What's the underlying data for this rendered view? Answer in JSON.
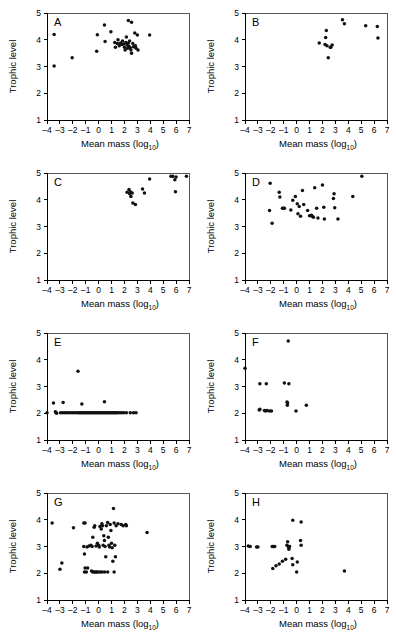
{
  "figure": {
    "axis_titles": {
      "x_main": "Mean mass (log",
      "x_sub": "10",
      "x_close": ")",
      "y": "Trophic level"
    },
    "x_ticks": [
      "-4",
      "-3",
      "-2",
      "-1",
      "0",
      "1",
      "2",
      "3",
      "4",
      "5",
      "6",
      "7"
    ],
    "y_ticks": [
      "1",
      "2",
      "3",
      "4",
      "5"
    ],
    "xlim": [
      -4,
      7
    ],
    "ylim": [
      1,
      5
    ],
    "point_color": "#111111",
    "axis_color": "#000000"
  },
  "chart_data": [
    {
      "type": "scatter",
      "panel": "A",
      "title": "A",
      "xlabel": "Mean mass (log10)",
      "ylabel": "Trophic level",
      "xlim": [
        -4,
        7
      ],
      "ylim": [
        1,
        5
      ],
      "grid": false,
      "legend": "none",
      "points": [
        [
          -3.45,
          4.2
        ],
        [
          -3.45,
          3.02
        ],
        [
          -2.05,
          3.33
        ],
        [
          -0.1,
          4.19
        ],
        [
          -0.15,
          3.57
        ],
        [
          0.45,
          4.55
        ],
        [
          0.5,
          3.93
        ],
        [
          0.95,
          4.3
        ],
        [
          1.25,
          3.9
        ],
        [
          1.3,
          3.72
        ],
        [
          1.45,
          3.86
        ],
        [
          1.5,
          4.0
        ],
        [
          1.6,
          3.78
        ],
        [
          1.7,
          3.88
        ],
        [
          1.8,
          3.82
        ],
        [
          1.85,
          3.95
        ],
        [
          1.95,
          3.84
        ],
        [
          2.0,
          3.72
        ],
        [
          2.05,
          3.62
        ],
        [
          2.1,
          3.9
        ],
        [
          2.15,
          4.1
        ],
        [
          2.2,
          3.8
        ],
        [
          2.25,
          3.68
        ],
        [
          2.3,
          3.88
        ],
        [
          2.35,
          3.76
        ],
        [
          2.4,
          3.95
        ],
        [
          2.45,
          3.7
        ],
        [
          2.5,
          3.62
        ],
        [
          2.3,
          4.72
        ],
        [
          2.55,
          4.65
        ],
        [
          2.55,
          3.5
        ],
        [
          2.65,
          3.86
        ],
        [
          2.7,
          3.74
        ],
        [
          2.8,
          4.25
        ],
        [
          2.85,
          3.78
        ],
        [
          2.9,
          3.68
        ],
        [
          3.05,
          3.62
        ],
        [
          3.0,
          4.18
        ],
        [
          3.95,
          4.18
        ]
      ]
    },
    {
      "type": "scatter",
      "panel": "B",
      "title": "B",
      "xlabel": "Mean mass (log10)",
      "ylabel": "Trophic level",
      "xlim": [
        -4,
        7
      ],
      "ylim": [
        1,
        5
      ],
      "grid": false,
      "legend": "none",
      "points": [
        [
          1.75,
          3.88
        ],
        [
          2.2,
          3.82
        ],
        [
          2.25,
          4.08
        ],
        [
          2.3,
          4.35
        ],
        [
          2.35,
          3.78
        ],
        [
          2.45,
          3.33
        ],
        [
          2.6,
          3.72
        ],
        [
          2.65,
          3.72
        ],
        [
          2.75,
          3.8
        ],
        [
          3.55,
          4.75
        ],
        [
          3.7,
          4.6
        ],
        [
          5.35,
          4.52
        ],
        [
          6.25,
          4.5
        ],
        [
          6.3,
          4.07
        ]
      ]
    },
    {
      "type": "scatter",
      "panel": "C",
      "title": "C",
      "xlabel": "Mean mass (log10)",
      "ylabel": "Trophic level",
      "xlim": [
        -4,
        7
      ],
      "ylim": [
        1,
        5
      ],
      "grid": false,
      "legend": "none",
      "points": [
        [
          2.2,
          4.28
        ],
        [
          2.35,
          4.38
        ],
        [
          2.4,
          4.22
        ],
        [
          2.45,
          4.3
        ],
        [
          2.5,
          4.12
        ],
        [
          2.6,
          4.25
        ],
        [
          2.65,
          3.88
        ],
        [
          2.85,
          3.82
        ],
        [
          3.4,
          4.4
        ],
        [
          3.55,
          4.25
        ],
        [
          3.95,
          4.78
        ],
        [
          5.6,
          4.88
        ],
        [
          5.75,
          4.88
        ],
        [
          5.9,
          4.75
        ],
        [
          6.0,
          4.85
        ],
        [
          5.95,
          4.3
        ],
        [
          6.8,
          4.88
        ]
      ]
    },
    {
      "type": "scatter",
      "panel": "D",
      "title": "D",
      "xlabel": "Mean mass (log10)",
      "ylabel": "Trophic level",
      "xlim": [
        -4,
        7
      ],
      "ylim": [
        1,
        5
      ],
      "grid": false,
      "legend": "none",
      "points": [
        [
          -2.05,
          4.62
        ],
        [
          -2.1,
          3.6
        ],
        [
          -1.9,
          3.12
        ],
        [
          -1.35,
          4.28
        ],
        [
          -1.3,
          4.1
        ],
        [
          -1.1,
          3.68
        ],
        [
          -1.0,
          3.68
        ],
        [
          -0.95,
          3.68
        ],
        [
          -0.45,
          3.62
        ],
        [
          -0.3,
          3.98
        ],
        [
          -0.1,
          4.12
        ],
        [
          0.05,
          3.85
        ],
        [
          0.1,
          3.48
        ],
        [
          0.2,
          3.75
        ],
        [
          0.3,
          3.38
        ],
        [
          0.45,
          4.35
        ],
        [
          0.55,
          3.82
        ],
        [
          0.85,
          3.6
        ],
        [
          1.0,
          3.4
        ],
        [
          1.15,
          3.42
        ],
        [
          1.2,
          3.38
        ],
        [
          1.3,
          3.35
        ],
        [
          1.4,
          4.45
        ],
        [
          1.55,
          3.68
        ],
        [
          1.65,
          3.32
        ],
        [
          2.0,
          4.55
        ],
        [
          2.1,
          3.72
        ],
        [
          2.15,
          3.28
        ],
        [
          2.85,
          4.05
        ],
        [
          2.9,
          4.22
        ],
        [
          2.95,
          3.7
        ],
        [
          3.2,
          3.28
        ],
        [
          4.35,
          4.12
        ],
        [
          5.05,
          4.88
        ]
      ]
    },
    {
      "type": "scatter",
      "panel": "E",
      "title": "E",
      "xlabel": "Mean mass (log10)",
      "ylabel": "Trophic level",
      "xlim": [
        -4,
        7
      ],
      "ylim": [
        1,
        5
      ],
      "grid": false,
      "legend": "none",
      "points": [
        [
          -1.6,
          3.57
        ],
        [
          -3.5,
          2.38
        ],
        [
          -2.75,
          2.4
        ],
        [
          -1.3,
          2.35
        ],
        [
          0.45,
          2.43
        ],
        [
          -4.0,
          2.02
        ],
        [
          -3.35,
          2.06
        ],
        [
          -3.3,
          2.02
        ],
        [
          -3.25,
          2.0
        ],
        [
          -2.95,
          2.02
        ],
        [
          -2.8,
          2.02
        ],
        [
          -2.65,
          2.02
        ],
        [
          -2.5,
          2.02
        ],
        [
          -2.35,
          2.02
        ],
        [
          -2.2,
          2.02
        ],
        [
          -2.05,
          2.02
        ],
        [
          -1.9,
          2.02
        ],
        [
          -1.75,
          2.02
        ],
        [
          -1.6,
          2.02
        ],
        [
          -1.5,
          2.02
        ],
        [
          -1.4,
          2.02
        ],
        [
          -1.3,
          2.02
        ],
        [
          -1.2,
          2.02
        ],
        [
          -1.1,
          2.02
        ],
        [
          -1.0,
          2.02
        ],
        [
          -0.9,
          2.02
        ],
        [
          -0.8,
          2.02
        ],
        [
          -0.7,
          2.02
        ],
        [
          -0.6,
          2.02
        ],
        [
          -0.5,
          2.02
        ],
        [
          -0.4,
          2.02
        ],
        [
          -0.3,
          2.02
        ],
        [
          -0.2,
          2.02
        ],
        [
          -0.1,
          2.02
        ],
        [
          0.0,
          2.02
        ],
        [
          0.1,
          2.02
        ],
        [
          0.2,
          2.02
        ],
        [
          0.3,
          2.02
        ],
        [
          0.4,
          2.02
        ],
        [
          0.5,
          2.02
        ],
        [
          0.6,
          2.02
        ],
        [
          0.7,
          2.02
        ],
        [
          0.8,
          2.02
        ],
        [
          0.9,
          2.02
        ],
        [
          1.0,
          2.02
        ],
        [
          1.1,
          2.02
        ],
        [
          1.2,
          2.02
        ],
        [
          1.3,
          2.02
        ],
        [
          1.4,
          2.02
        ],
        [
          1.5,
          2.02
        ],
        [
          1.65,
          2.02
        ],
        [
          1.8,
          2.02
        ],
        [
          1.95,
          2.02
        ],
        [
          2.15,
          2.02
        ],
        [
          2.45,
          2.02
        ],
        [
          2.7,
          2.02
        ],
        [
          2.9,
          2.02
        ]
      ]
    },
    {
      "type": "scatter",
      "panel": "F",
      "title": "F",
      "xlabel": "Mean mass (log10)",
      "ylabel": "Trophic level",
      "xlim": [
        -4,
        7
      ],
      "ylim": [
        1,
        5
      ],
      "grid": false,
      "legend": "none",
      "points": [
        [
          -4.0,
          3.68
        ],
        [
          -0.65,
          4.7
        ],
        [
          -2.85,
          3.1
        ],
        [
          -2.35,
          3.1
        ],
        [
          -0.95,
          3.13
        ],
        [
          -0.6,
          3.1
        ],
        [
          -0.75,
          2.42
        ],
        [
          -0.7,
          2.38
        ],
        [
          -0.72,
          2.3
        ],
        [
          -2.9,
          2.12
        ],
        [
          -2.85,
          2.15
        ],
        [
          -2.5,
          2.1
        ],
        [
          -2.4,
          2.08
        ],
        [
          -2.3,
          2.1
        ],
        [
          -2.1,
          2.08
        ],
        [
          -1.95,
          2.08
        ],
        [
          -0.05,
          2.08
        ],
        [
          0.75,
          2.3
        ]
      ]
    },
    {
      "type": "scatter",
      "panel": "G",
      "title": "G",
      "xlabel": "Mean mass (log10)",
      "ylabel": "Trophic level",
      "xlim": [
        -4,
        7
      ],
      "ylim": [
        1,
        5
      ],
      "grid": false,
      "legend": "none",
      "points": [
        [
          -3.6,
          3.88
        ],
        [
          -3.0,
          2.15
        ],
        [
          -2.85,
          2.38
        ],
        [
          -1.95,
          3.7
        ],
        [
          -1.15,
          3.88
        ],
        [
          -1.05,
          3.88
        ],
        [
          -1.1,
          2.72
        ],
        [
          -1.15,
          3.0
        ],
        [
          -0.9,
          2.98
        ],
        [
          -0.75,
          3.02
        ],
        [
          -0.6,
          3.05
        ],
        [
          -0.5,
          3.0
        ],
        [
          -0.45,
          3.35
        ],
        [
          -0.35,
          3.72
        ],
        [
          -0.3,
          3.78
        ],
        [
          -0.2,
          3.02
        ],
        [
          -0.1,
          3.12
        ],
        [
          0.0,
          3.05
        ],
        [
          0.05,
          2.98
        ],
        [
          0.1,
          3.75
        ],
        [
          0.2,
          3.65
        ],
        [
          0.25,
          3.85
        ],
        [
          0.3,
          3.78
        ],
        [
          0.35,
          3.05
        ],
        [
          0.4,
          3.4
        ],
        [
          0.45,
          3.22
        ],
        [
          0.5,
          3.0
        ],
        [
          0.55,
          2.62
        ],
        [
          0.6,
          3.78
        ],
        [
          0.7,
          3.9
        ],
        [
          0.75,
          3.35
        ],
        [
          0.8,
          3.05
        ],
        [
          0.85,
          2.98
        ],
        [
          0.9,
          3.82
        ],
        [
          0.95,
          3.6
        ],
        [
          1.0,
          3.12
        ],
        [
          1.05,
          2.95
        ],
        [
          1.1,
          2.45
        ],
        [
          1.15,
          4.42
        ],
        [
          1.2,
          3.88
        ],
        [
          1.25,
          3.05
        ],
        [
          1.3,
          2.62
        ],
        [
          1.35,
          3.78
        ],
        [
          1.5,
          3.85
        ],
        [
          1.75,
          3.82
        ],
        [
          1.9,
          3.78
        ],
        [
          2.1,
          3.82
        ],
        [
          2.15,
          3.78
        ],
        [
          3.75,
          3.52
        ],
        [
          -1.1,
          2.05
        ],
        [
          -1.05,
          2.2
        ],
        [
          -0.95,
          2.05
        ],
        [
          -0.85,
          2.2
        ],
        [
          -0.55,
          2.08
        ],
        [
          -0.45,
          2.05
        ],
        [
          -0.35,
          2.05
        ],
        [
          -0.25,
          2.05
        ],
        [
          -0.15,
          2.05
        ],
        [
          -0.05,
          2.05
        ],
        [
          0.1,
          2.05
        ],
        [
          0.25,
          2.05
        ],
        [
          0.45,
          2.05
        ],
        [
          0.7,
          2.05
        ],
        [
          1.2,
          2.05
        ]
      ]
    },
    {
      "type": "scatter",
      "panel": "H",
      "title": "H",
      "xlabel": "Mean mass (log10)",
      "ylabel": "Trophic level",
      "xlim": [
        -4,
        7
      ],
      "ylim": [
        1,
        5
      ],
      "grid": false,
      "legend": "none",
      "points": [
        [
          -0.3,
          3.98
        ],
        [
          0.35,
          3.92
        ],
        [
          -3.75,
          3.02
        ],
        [
          -3.6,
          3.0
        ],
        [
          -3.1,
          2.98
        ],
        [
          -3.0,
          2.98
        ],
        [
          -1.9,
          3.0
        ],
        [
          -1.8,
          3.0
        ],
        [
          -1.7,
          3.0
        ],
        [
          -0.75,
          3.05
        ],
        [
          -0.7,
          3.18
        ],
        [
          -0.65,
          3.0
        ],
        [
          -0.6,
          2.95
        ],
        [
          -0.6,
          2.9
        ],
        [
          -0.55,
          3.0
        ],
        [
          0.3,
          3.22
        ],
        [
          0.35,
          3.05
        ],
        [
          -1.85,
          2.18
        ],
        [
          -1.6,
          2.28
        ],
        [
          -1.35,
          2.35
        ],
        [
          -1.1,
          2.45
        ],
        [
          -0.85,
          2.52
        ],
        [
          -0.35,
          2.55
        ],
        [
          -0.3,
          2.32
        ],
        [
          0.05,
          2.42
        ],
        [
          0.0,
          2.05
        ],
        [
          3.7,
          2.08
        ]
      ]
    }
  ]
}
